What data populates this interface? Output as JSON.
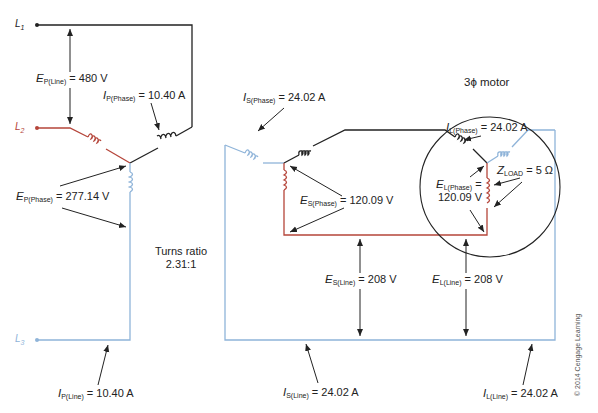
{
  "terminals": {
    "l1": {
      "label": "L",
      "sub": "1",
      "color": "#222222"
    },
    "l2": {
      "label": "L",
      "sub": "2",
      "color": "#c0392b"
    },
    "l3": {
      "label": "L",
      "sub": "3",
      "color": "#8fb4d9"
    }
  },
  "primary": {
    "e_line": {
      "sym": "E",
      "sub": "P(Line)",
      "value": "= 480 V"
    },
    "i_phase": {
      "sym": "I",
      "sub": "P(Phase)",
      "value": "= 10.40 A"
    },
    "e_phase": {
      "sym": "E",
      "sub": "P(Phase)",
      "value": "= 277.14 V"
    },
    "i_line": {
      "sym": "I",
      "sub": "P(Line)",
      "value": "= 10.40 A"
    }
  },
  "turns_ratio": {
    "line1": "Turns ratio",
    "line2": "2.31:1"
  },
  "secondary": {
    "i_phase": {
      "sym": "I",
      "sub": "S(Phase)",
      "value": "= 24.02 A"
    },
    "e_phase": {
      "sym": "E",
      "sub": "S(Phase)",
      "value": "= 120.09 V"
    },
    "e_line": {
      "sym": "E",
      "sub": "S(Line)",
      "value": "= 208 V"
    },
    "i_line": {
      "sym": "I",
      "sub": "S(Line)",
      "value": "= 24.02 A"
    }
  },
  "motor": {
    "title": "3ϕ motor",
    "i_phase": {
      "sym": "I",
      "sub": "L(Phase)",
      "value": "= 24.02 A"
    },
    "z_load": {
      "sym": "Z",
      "sub": "LOAD",
      "value": "= 5 Ω"
    },
    "e_phase": {
      "sym": "E",
      "sub": "L(Phase)",
      "value": "=",
      "value2": "120.09 V"
    },
    "e_line": {
      "sym": "E",
      "sub": "L(Line)",
      "value": "= 208 V"
    },
    "i_line": {
      "sym": "I",
      "sub": "L(Line)",
      "value": "= 24.02 A"
    }
  },
  "colors": {
    "black": "#222222",
    "red": "#b5453a",
    "blue": "#8fb4d9"
  },
  "copyright": "© 2014 Cengage Learning"
}
